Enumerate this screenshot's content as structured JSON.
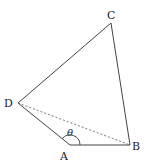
{
  "figure": {
    "type": "quadrilateral",
    "points": {
      "A": {
        "label": "A",
        "x": 70,
        "y": 145
      },
      "B": {
        "label": "B",
        "x": 130,
        "y": 145
      },
      "C": {
        "label": "C",
        "x": 111,
        "y": 23
      },
      "D": {
        "label": "D",
        "x": 18,
        "y": 103
      }
    },
    "solid_edges": [
      "AB",
      "BC",
      "CD",
      "DA"
    ],
    "dashed_edges": [
      "DB"
    ],
    "angle": {
      "vertex": "A",
      "label": "θ",
      "between": [
        "AD",
        "AB"
      ]
    }
  }
}
